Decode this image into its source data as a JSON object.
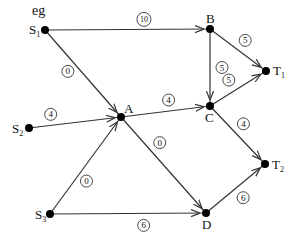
{
  "title": "eg",
  "colors": {
    "edge": "#333333",
    "node": "#000000",
    "text": "#111111",
    "background": "#ffffff"
  },
  "nodes": [
    {
      "id": "S1",
      "label": "S",
      "sub": "1",
      "x": 45,
      "y": 30
    },
    {
      "id": "B",
      "label": "B",
      "sub": "",
      "x": 210,
      "y": 29
    },
    {
      "id": "T1",
      "label": "T",
      "sub": "1",
      "x": 266,
      "y": 71
    },
    {
      "id": "C",
      "label": "C",
      "sub": "",
      "x": 210,
      "y": 106
    },
    {
      "id": "A",
      "label": "A",
      "sub": "",
      "x": 121,
      "y": 117
    },
    {
      "id": "S2",
      "label": "S",
      "sub": "2",
      "x": 29,
      "y": 128
    },
    {
      "id": "S3",
      "label": "S",
      "sub": "3",
      "x": 50,
      "y": 214
    },
    {
      "id": "D",
      "label": "D",
      "sub": "",
      "x": 206,
      "y": 213
    },
    {
      "id": "T2",
      "label": "T",
      "sub": "2",
      "x": 265,
      "y": 164
    }
  ],
  "edges": [
    {
      "from": "S1",
      "to": "B",
      "capacity": "10"
    },
    {
      "from": "S1",
      "to": "A",
      "capacity": "0"
    },
    {
      "from": "S2",
      "to": "A",
      "capacity": "4"
    },
    {
      "from": "S3",
      "to": "A",
      "capacity": "0"
    },
    {
      "from": "S3",
      "to": "D",
      "capacity": "6"
    },
    {
      "from": "A",
      "to": "C",
      "capacity": "4"
    },
    {
      "from": "A",
      "to": "D",
      "capacity": "0"
    },
    {
      "from": "B",
      "to": "C",
      "capacity": "5"
    },
    {
      "from": "B",
      "to": "T1",
      "capacity": "5"
    },
    {
      "from": "C",
      "to": "T1",
      "capacity": "5"
    },
    {
      "from": "C",
      "to": "T2",
      "capacity": "4"
    },
    {
      "from": "D",
      "to": "T2",
      "capacity": "6"
    }
  ]
}
